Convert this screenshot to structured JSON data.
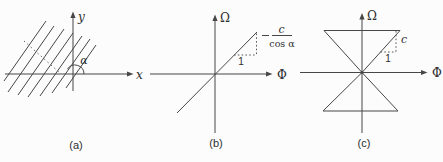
{
  "colors": {
    "background": "#fcfcfc",
    "line": "#474747",
    "text": "#2e2e2e"
  },
  "figures": {
    "a": {
      "caption": "(a)",
      "x_axis_label": "x",
      "y_axis_label": "y",
      "angle_label": "α"
    },
    "b": {
      "caption": "(b)",
      "horizontal_axis_label": "Φ",
      "vertical_axis_label": "Ω",
      "slope_run_label": "1",
      "slope_numerator": "c",
      "slope_denominator": "cos α"
    },
    "c": {
      "caption": "(c)",
      "horizontal_axis_label": "Φ",
      "vertical_axis_label": "Ω",
      "slope_run_label": "1",
      "slope_rise_label": "c"
    }
  }
}
